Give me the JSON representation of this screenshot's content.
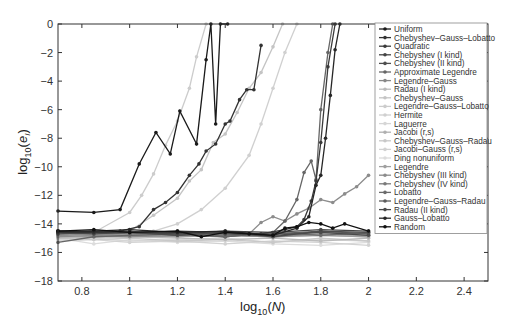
{
  "chart_data": {
    "type": "line",
    "title": "",
    "xlabel": "log10(N)",
    "ylabel": "log10(e_I)",
    "xlim": [
      0.7,
      2.5
    ],
    "ylim": [
      -18,
      0
    ],
    "grid": false,
    "legend_position": "upper right",
    "xticks": [
      "0.8",
      "1",
      "1.2",
      "1.4",
      "1.6",
      "1.8",
      "2",
      "2.2",
      "2.4"
    ],
    "xtick_values": [
      0.8,
      1.0,
      1.2,
      1.4,
      1.6,
      1.8,
      2.0,
      2.2,
      2.4
    ],
    "yticks": [
      "0",
      "-2",
      "-4",
      "-6",
      "-8",
      "-10",
      "-12",
      "-14",
      "-16",
      "-18"
    ],
    "ytick_values": [
      0,
      -2,
      -4,
      -6,
      -8,
      -10,
      -12,
      -14,
      -16,
      -18
    ],
    "series": [
      {
        "name": "Uniform",
        "color": "#1a1a1a",
        "x": [
          0.7,
          0.85,
          0.96,
          1.04,
          1.11,
          1.17,
          1.21,
          1.28,
          1.32,
          1.34,
          1.36,
          1.38,
          1.41
        ],
        "values": [
          -13.1,
          -13.2,
          -13.0,
          -9.8,
          -7.6,
          -9.1,
          -6.1,
          -8.4,
          -2.5,
          0,
          -7.0,
          0,
          0
        ]
      },
      {
        "name": "Chebyshev–Gauss–Lobatto",
        "color": "#333333",
        "x": [
          0.7,
          0.85,
          0.96,
          1.04,
          1.1,
          1.15,
          1.2,
          1.25,
          1.29,
          1.32,
          1.36,
          1.4,
          1.42,
          1.46,
          1.49,
          1.52,
          1.55
        ],
        "values": [
          -14.6,
          -14.6,
          -14.5,
          -14.2,
          -13.0,
          -12.5,
          -11.8,
          -10.6,
          -9.8,
          -8.9,
          -8.4,
          -7.0,
          -6.8,
          -5.3,
          -4.6,
          -4.6,
          -1.5
        ]
      },
      {
        "name": "Quadratic",
        "color": "#3a3a3a",
        "x": [
          0.7,
          0.85,
          1.0,
          1.2,
          1.4,
          1.55,
          1.65,
          1.7,
          1.73,
          1.76,
          1.78,
          1.8,
          1.83,
          1.86
        ],
        "values": [
          -14.5,
          -14.6,
          -14.6,
          -14.5,
          -14.6,
          -14.7,
          -14.4,
          -14.2,
          -13.7,
          -12.4,
          -11.0,
          -8.3,
          -3.0,
          0
        ]
      },
      {
        "name": "Chebyshev (I kind)",
        "color": "#444444",
        "x": [
          0.7,
          0.85,
          1.0,
          1.2,
          1.4,
          1.6,
          1.8,
          2.0
        ],
        "values": [
          -14.6,
          -14.5,
          -14.6,
          -14.7,
          -14.5,
          -14.6,
          -14.4,
          -14.5
        ]
      },
      {
        "name": "Chebyshev (II kind)",
        "color": "#4d4d4d",
        "x": [
          0.7,
          0.85,
          1.0,
          1.2,
          1.4,
          1.6,
          1.8,
          2.0
        ],
        "values": [
          -14.7,
          -14.6,
          -14.6,
          -14.8,
          -14.6,
          -14.9,
          -14.5,
          -14.6
        ]
      },
      {
        "name": "Approximate Legendre",
        "color": "#666666",
        "x": [
          0.7,
          0.85,
          1.0,
          1.2,
          1.4,
          1.6,
          1.65,
          1.7,
          1.73,
          1.76,
          1.78,
          1.8,
          1.83,
          1.85
        ],
        "values": [
          -15.3,
          -14.9,
          -14.8,
          -14.7,
          -14.9,
          -14.6,
          -13.8,
          -12.3,
          -10.4,
          -9.6,
          -10.9,
          -6.0,
          -2.0,
          0
        ]
      },
      {
        "name": "Legendre–Gauss",
        "color": "#888888",
        "x": [
          0.7,
          0.85,
          1.0,
          1.2,
          1.4,
          1.6,
          1.8,
          2.0
        ],
        "values": [
          -14.8,
          -14.7,
          -14.8,
          -14.7,
          -14.8,
          -14.9,
          -14.7,
          -14.8
        ]
      },
      {
        "name": "Radau (I kind)",
        "color": "#bbbbbb",
        "x": [
          0.7,
          0.85,
          1.0,
          1.2,
          1.4,
          1.6,
          1.8,
          2.0
        ],
        "values": [
          -15.0,
          -14.9,
          -14.9,
          -15.0,
          -15.1,
          -15.0,
          -15.2,
          -15.0
        ]
      },
      {
        "name": "Chebyshev–Gauss",
        "color": "#c4c4c4",
        "x": [
          0.7,
          0.85,
          1.0,
          1.1,
          1.2,
          1.25,
          1.3,
          1.35,
          1.4,
          1.45,
          1.5,
          1.55,
          1.6,
          1.64
        ],
        "values": [
          -14.6,
          -14.7,
          -14.5,
          -13.4,
          -12.2,
          -11.0,
          -10.2,
          -8.3,
          -7.7,
          -6.2,
          -4.5,
          -3.4,
          -1.6,
          0
        ]
      },
      {
        "name": "Legendre–Gauss–Lobatto",
        "color": "#cccccc",
        "x": [
          0.7,
          0.85,
          1.0,
          1.05,
          1.1,
          1.15,
          1.2,
          1.25,
          1.28,
          1.32
        ],
        "values": [
          -14.5,
          -14.6,
          -13.2,
          -12.0,
          -10.5,
          -8.5,
          -6.8,
          -4.5,
          -2.3,
          0
        ]
      },
      {
        "name": "Hermite",
        "color": "#d0d0d0",
        "x": [
          0.7,
          0.85,
          1.0,
          1.1,
          1.2,
          1.3,
          1.4,
          1.5,
          1.55,
          1.6,
          1.65,
          1.7
        ],
        "values": [
          -14.9,
          -15.0,
          -14.9,
          -14.5,
          -14.0,
          -13.0,
          -11.5,
          -9.2,
          -7.0,
          -4.5,
          -2.0,
          0
        ]
      },
      {
        "name": "Laguerre",
        "color": "#d6d6d6",
        "x": [
          0.7,
          0.85,
          1.0,
          1.2,
          1.4,
          1.6,
          1.8,
          2.0
        ],
        "values": [
          -15.1,
          -15.0,
          -15.2,
          -15.1,
          -15.0,
          -15.3,
          -15.1,
          -15.2
        ]
      },
      {
        "name": "Jacobi (r,s)",
        "color": "#b0b0b0",
        "x": [
          0.7,
          0.85,
          1.0,
          1.2,
          1.4,
          1.6,
          1.8,
          2.0
        ],
        "values": [
          -14.7,
          -14.8,
          -14.7,
          -14.9,
          -14.8,
          -14.9,
          -14.8,
          -14.9
        ]
      },
      {
        "name": "Chebyshev–Gauss–Radau",
        "color": "#c8c8c8",
        "x": [
          0.7,
          0.85,
          1.0,
          1.2,
          1.4,
          1.6,
          1.8,
          2.0
        ],
        "values": [
          -15.0,
          -15.1,
          -15.0,
          -15.2,
          -15.1,
          -15.3,
          -15.0,
          -15.2
        ]
      },
      {
        "name": "Jacobi–Gauss (r,s)",
        "color": "#d2d2d2",
        "x": [
          0.7,
          0.85,
          1.0,
          1.2,
          1.4,
          1.6,
          1.8,
          2.0
        ],
        "values": [
          -15.2,
          -15.1,
          -15.3,
          -15.2,
          -15.4,
          -15.2,
          -15.3,
          -15.5
        ]
      },
      {
        "name": "Ding nonuniform",
        "color": "#dcdcdc",
        "x": [
          0.7,
          0.85,
          1.0,
          1.2,
          1.4,
          1.6,
          1.8,
          2.0
        ],
        "values": [
          -15.0,
          -15.4,
          -15.1,
          -15.3,
          -15.2,
          -15.4,
          -15.5,
          -15.3
        ]
      },
      {
        "name": "Legendre",
        "color": "#a0a0a0",
        "x": [
          0.7,
          0.85,
          1.0,
          1.2,
          1.4,
          1.6,
          1.8,
          2.0
        ],
        "values": [
          -14.8,
          -14.9,
          -14.8,
          -14.9,
          -14.7,
          -14.9,
          -14.8,
          -14.9
        ]
      },
      {
        "name": "Chebyshev (III kind)",
        "color": "#8c8c8c",
        "x": [
          0.7,
          0.85,
          1.0,
          1.2,
          1.4,
          1.5,
          1.55,
          1.6,
          1.65,
          1.7,
          1.75,
          1.8,
          1.85,
          1.9,
          1.95,
          2.0
        ],
        "values": [
          -14.9,
          -14.8,
          -14.9,
          -14.8,
          -14.9,
          -14.7,
          -13.9,
          -13.5,
          -13.8,
          -13.3,
          -12.9,
          -12.3,
          -12.5,
          -11.9,
          -11.4,
          -10.6
        ]
      },
      {
        "name": "Chebyshev (IV kind)",
        "color": "#7a7a7a",
        "x": [
          0.7,
          0.85,
          1.0,
          1.2,
          1.4,
          1.6,
          1.8,
          2.0
        ],
        "values": [
          -14.6,
          -14.7,
          -14.6,
          -14.7,
          -14.8,
          -14.7,
          -14.6,
          -14.7
        ]
      },
      {
        "name": "Lobatto",
        "color": "#6b6b6b",
        "x": [
          0.7,
          0.85,
          1.0,
          1.2,
          1.4,
          1.6,
          1.8,
          2.0
        ],
        "values": [
          -14.7,
          -14.6,
          -14.7,
          -14.6,
          -14.9,
          -14.6,
          -14.8,
          -14.6
        ]
      },
      {
        "name": "Legendre–Gauss–Radau",
        "color": "#5c5c5c",
        "x": [
          0.7,
          0.85,
          1.0,
          1.2,
          1.4,
          1.6,
          1.8,
          2.0
        ],
        "values": [
          -14.5,
          -14.6,
          -14.5,
          -14.8,
          -14.6,
          -14.7,
          -14.5,
          -14.7
        ]
      },
      {
        "name": "Radau (II kind)",
        "color": "#4a4a4a",
        "x": [
          0.7,
          0.85,
          1.0,
          1.2,
          1.4,
          1.6,
          1.8,
          2.0
        ],
        "values": [
          -14.6,
          -14.7,
          -14.6,
          -14.6,
          -14.7,
          -14.8,
          -14.6,
          -14.8
        ]
      },
      {
        "name": "Gauss–Lobatto",
        "color": "#262626",
        "x": [
          0.7,
          0.85,
          1.0,
          1.2,
          1.4,
          1.6,
          1.7,
          1.75,
          1.78,
          1.8,
          1.82,
          1.84,
          1.86,
          1.88
        ],
        "values": [
          -14.5,
          -14.5,
          -14.4,
          -14.6,
          -14.5,
          -14.8,
          -14.3,
          -13.5,
          -11.3,
          -10.6,
          -8.0,
          -5.0,
          -1.8,
          0
        ]
      },
      {
        "name": "Random",
        "color": "#111111",
        "x": [
          0.7,
          0.85,
          1.0,
          1.2,
          1.3,
          1.4,
          1.5,
          1.6,
          1.65,
          1.7,
          1.75,
          1.8,
          1.85,
          1.9,
          2.0
        ],
        "values": [
          -14.5,
          -14.4,
          -14.6,
          -14.5,
          -14.9,
          -14.6,
          -14.7,
          -14.8,
          -14.3,
          -14.2,
          -13.9,
          -14.0,
          -14.3,
          -14.0,
          -14.5
        ]
      }
    ]
  }
}
